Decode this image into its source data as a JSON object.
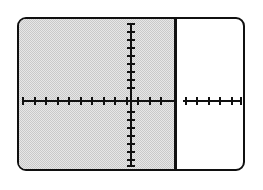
{
  "figure": {
    "name": "coordinate-plane-inequality-graph",
    "frame_color": "#101010",
    "background_color": "#ffffff",
    "shade_color": "#c9c9c9"
  },
  "chart_data": {
    "type": "line",
    "title": "",
    "subtitle": "",
    "xlabel": "",
    "ylabel": "",
    "xlim": [
      -12,
      8
    ],
    "ylim": [
      -9,
      9
    ],
    "grid": false,
    "legend": null,
    "axes": {
      "x_axis": {
        "label": "",
        "tick_values": [
          -11,
          -10,
          -9,
          -8,
          -7,
          -6,
          -5,
          -4,
          -3,
          -2,
          -1,
          1,
          2,
          3,
          4,
          5,
          6,
          7
        ],
        "tick_labels": [],
        "visible": true
      },
      "y_axis": {
        "label": "",
        "tick_values": [
          -9,
          -8,
          -7,
          -6,
          -5,
          -4,
          -3,
          -2,
          -1,
          1,
          2,
          3,
          4,
          5,
          6,
          7,
          8
        ],
        "tick_labels": [],
        "visible": true
      }
    },
    "series": [
      {
        "name": "boundary-line",
        "type": "vertical-line",
        "style": "solid",
        "color": "#101010",
        "x": 4
      }
    ],
    "shaded_regions": [
      {
        "name": "solution-region",
        "relation": "x <= 4",
        "side": "left",
        "boundary_x": 4,
        "fill": "#c9c9c9",
        "pattern": "dithered-halftone"
      }
    ],
    "annotations": [],
    "data_labels": []
  },
  "ticks": {
    "x_left": [
      3,
      15,
      26,
      38,
      49,
      61,
      72,
      84,
      95,
      107,
      118
    ],
    "x_right": [
      130,
      141,
      166,
      177,
      189,
      200,
      212,
      221
    ],
    "y": [
      4,
      12,
      20,
      28,
      36,
      44,
      52,
      60,
      68,
      92,
      100,
      108,
      116,
      124,
      132,
      140,
      146
    ]
  }
}
